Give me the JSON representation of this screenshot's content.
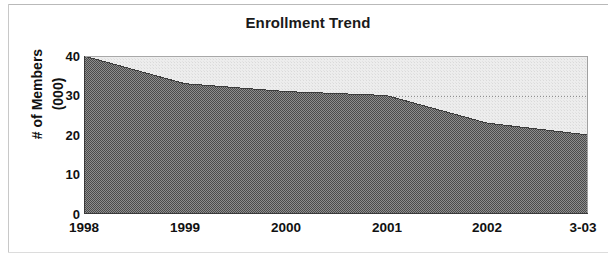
{
  "chart_data": {
    "type": "area",
    "title": "Enrollment Trend",
    "xlabel": "",
    "ylabel": "# of Members (000)",
    "ylabel_line1": "# of Members",
    "ylabel_line2": "(000)",
    "categories": [
      "1998",
      "1999",
      "2000",
      "2001",
      "2002",
      "3-03"
    ],
    "x": [
      "1998",
      "1999",
      "2000",
      "2001",
      "2002",
      "3-03"
    ],
    "values": [
      40,
      33,
      31,
      30,
      23,
      20
    ],
    "series": [
      {
        "name": "# of Members (000)",
        "values": [
          40,
          33,
          31,
          30,
          23,
          20
        ]
      }
    ],
    "ylim": [
      0,
      40
    ],
    "yticks": [
      "40",
      "30",
      "20",
      "10",
      "0"
    ],
    "ytick_values": [
      40,
      30,
      20,
      10,
      0
    ],
    "y_minor_tick_interval": 5,
    "xticks": [
      "1998",
      "1999",
      "2000",
      "2001",
      "2002",
      "3-03"
    ],
    "grid": "horizontal-dotted-at-30",
    "legend": "none",
    "legend_position": "none",
    "colors": {
      "area_fill": "#6e6e6e",
      "plot_background": "#ebebeb",
      "axis": "#4d4d4d",
      "text": "#111111",
      "gridline": "#9a9a9a"
    }
  },
  "chart": {
    "title": "Enrollment Trend",
    "y_axis_title_line1": "# of Members",
    "y_axis_title_line2": "(000)",
    "y_ticks": [
      "40",
      "30",
      "20",
      "10",
      "0"
    ],
    "x_ticks": [
      "1998",
      "1999",
      "2000",
      "2001",
      "2002",
      "3-03"
    ]
  }
}
